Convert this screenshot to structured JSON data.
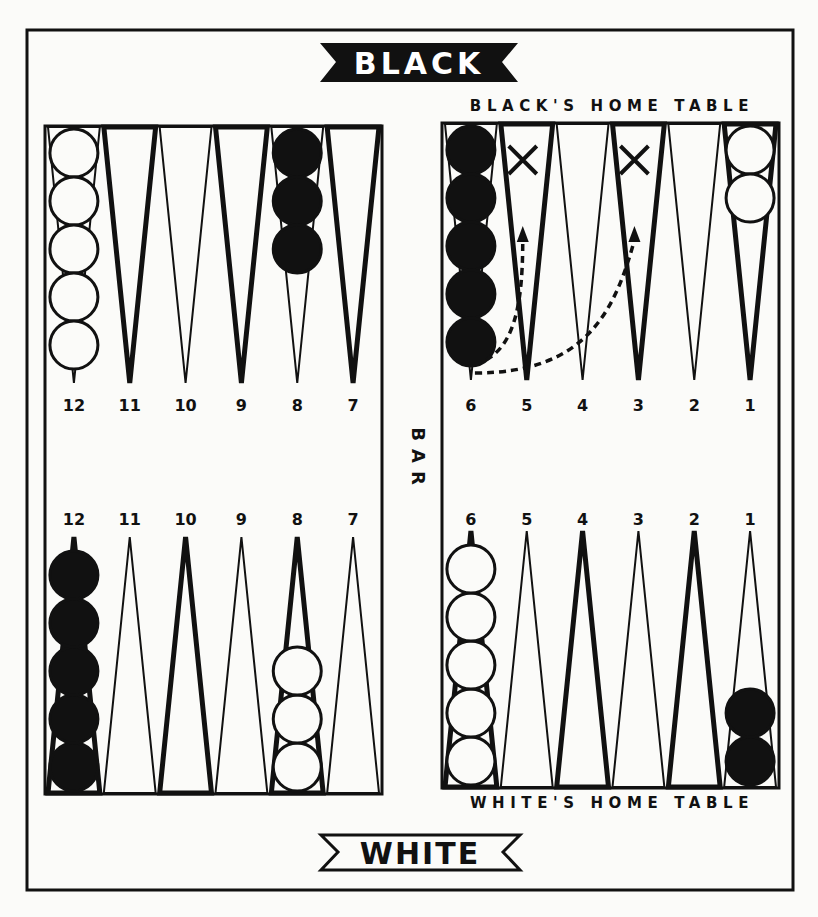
{
  "banners": {
    "top": {
      "text": "BLACK",
      "style": "inverted"
    },
    "bottom": {
      "text": "WHITE",
      "style": "outlined"
    }
  },
  "labels": {
    "black_home": "BLACK'S HOME TABLE",
    "white_home": "WHITE'S HOME TABLE",
    "bar": "BAR"
  },
  "colors": {
    "ink": "#111111",
    "paper": "#fbfbf9"
  },
  "quadrants": {
    "top_left": {
      "points": [
        {
          "num": "12",
          "style": "thin"
        },
        {
          "num": "11",
          "style": "thick"
        },
        {
          "num": "10",
          "style": "thin"
        },
        {
          "num": "9",
          "style": "thick"
        },
        {
          "num": "8",
          "style": "thin"
        },
        {
          "num": "7",
          "style": "thick"
        }
      ],
      "checkers": [
        {
          "point_index": 0,
          "color": "white",
          "count": 5
        },
        {
          "point_index": 4,
          "color": "black",
          "count": 3
        }
      ]
    },
    "top_right": {
      "points": [
        {
          "num": "6",
          "style": "thin"
        },
        {
          "num": "5",
          "style": "thick"
        },
        {
          "num": "4",
          "style": "thin"
        },
        {
          "num": "3",
          "style": "thick"
        },
        {
          "num": "2",
          "style": "thin"
        },
        {
          "num": "1",
          "style": "thick"
        }
      ],
      "checkers": [
        {
          "point_index": 0,
          "color": "black",
          "count": 5
        },
        {
          "point_index": 5,
          "color": "white",
          "count": 2
        }
      ],
      "x_marks": [
        1,
        3
      ],
      "move_arrows": [
        {
          "from_index": 0,
          "to_index": 1
        },
        {
          "from_index": 0,
          "to_index": 3
        }
      ]
    },
    "bottom_left": {
      "points": [
        {
          "num": "12",
          "style": "thick"
        },
        {
          "num": "11",
          "style": "thin"
        },
        {
          "num": "10",
          "style": "thick"
        },
        {
          "num": "9",
          "style": "thin"
        },
        {
          "num": "8",
          "style": "thick"
        },
        {
          "num": "7",
          "style": "thin"
        }
      ],
      "checkers": [
        {
          "point_index": 0,
          "color": "black",
          "count": 5
        },
        {
          "point_index": 4,
          "color": "white",
          "count": 3
        }
      ]
    },
    "bottom_right": {
      "points": [
        {
          "num": "6",
          "style": "thick"
        },
        {
          "num": "5",
          "style": "thin"
        },
        {
          "num": "4",
          "style": "thick"
        },
        {
          "num": "3",
          "style": "thin"
        },
        {
          "num": "2",
          "style": "thick"
        },
        {
          "num": "1",
          "style": "thin"
        }
      ],
      "checkers": [
        {
          "point_index": 0,
          "color": "white",
          "count": 5
        },
        {
          "point_index": 5,
          "color": "black",
          "count": 2
        }
      ]
    }
  }
}
